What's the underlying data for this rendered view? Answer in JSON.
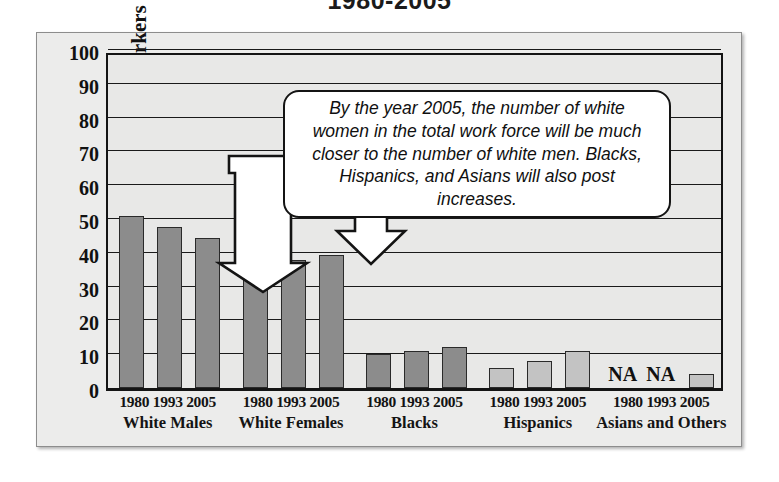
{
  "title": "1980-2005",
  "callout": {
    "text": "By the year 2005, the number of white women in the total work force will be much closer to the number of white men. Blacks, Hispanics, and Asians will also post increases."
  },
  "axis": {
    "y_title": "Percentage of Total Workers",
    "y_ticks": [
      "100",
      "90",
      "80",
      "70",
      "60",
      "50",
      "40",
      "30",
      "20",
      "10",
      "0"
    ]
  },
  "na_labels": {
    "first": "NA",
    "second": "NA"
  },
  "groups": [
    {
      "name": "White Males",
      "years": "1980 1993 2005"
    },
    {
      "name": "White Females",
      "years": "1980 1993 2005"
    },
    {
      "name": "Blacks",
      "years": "1980 1993 2005"
    },
    {
      "name": "Hispanics",
      "years": "1980 1993 2005"
    },
    {
      "name": "Asians and Others",
      "years": "1980 1993 2005"
    }
  ],
  "colors": {
    "bar_dark": "#8c8c8c",
    "bar_light": "#c3c3c3",
    "plot_bg": "#e8e8e7",
    "frame_bg": "#ececeb",
    "ink": "#141414"
  },
  "chart_data": {
    "type": "bar",
    "title": "1980-2005",
    "xlabel": "",
    "ylabel": "Percentage of Total Workers",
    "ylim": [
      0,
      100
    ],
    "ytick_step": 10,
    "grid": true,
    "legend": "none",
    "categories": [
      "White Males",
      "White Females",
      "Blacks",
      "Hispanics",
      "Asians and Others"
    ],
    "x": [
      "1980",
      "1993",
      "2005"
    ],
    "series": [
      {
        "name": "1980",
        "values": [
          51,
          36,
          10,
          6,
          null
        ]
      },
      {
        "name": "1993",
        "values": [
          47.5,
          38,
          11,
          8,
          null
        ]
      },
      {
        "name": "2005",
        "values": [
          44.5,
          39.5,
          12,
          11,
          4
        ]
      }
    ],
    "bars": [
      {
        "group": "White Males",
        "year": "1980",
        "value": 51
      },
      {
        "group": "White Males",
        "year": "1993",
        "value": 47.5
      },
      {
        "group": "White Males",
        "year": "2005",
        "value": 44.5
      },
      {
        "group": "White Females",
        "year": "1980",
        "value": 36
      },
      {
        "group": "White Females",
        "year": "1993",
        "value": 38
      },
      {
        "group": "White Females",
        "year": "2005",
        "value": 39.5
      },
      {
        "group": "Blacks",
        "year": "1980",
        "value": 10
      },
      {
        "group": "Blacks",
        "year": "1993",
        "value": 11
      },
      {
        "group": "Blacks",
        "year": "2005",
        "value": 12
      },
      {
        "group": "Hispanics",
        "year": "1980",
        "value": 6
      },
      {
        "group": "Hispanics",
        "year": "1993",
        "value": 8
      },
      {
        "group": "Hispanics",
        "year": "2005",
        "value": 11
      },
      {
        "group": "Asians and Others",
        "year": "1980",
        "value": null,
        "label": "NA"
      },
      {
        "group": "Asians and Others",
        "year": "1993",
        "value": null,
        "label": "NA"
      },
      {
        "group": "Asians and Others",
        "year": "2005",
        "value": 4
      }
    ],
    "annotations": [
      {
        "text": "By the year 2005, the number of white women in the total work force will be much closer to the number of white men. Blacks, Hispanics, and Asians will also post increases.",
        "points_to": [
          "White Males 2005",
          "White Females 2005"
        ]
      }
    ]
  }
}
